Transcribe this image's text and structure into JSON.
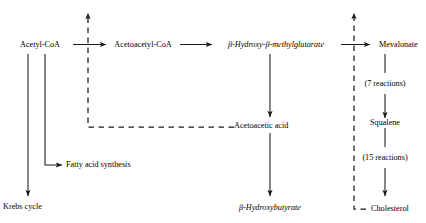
{
  "diagram": {
    "background_color": "#ffffff",
    "line_color": "#1a1a1a",
    "text_color": "#000000",
    "nodes": {
      "acetyl_coa": "Acetyl-CoA",
      "acetoacetyl_coa": "Acetoacetyl-CoA",
      "hmg": "β-Hydroxy-β-methylglutarate",
      "mevalonate": "Mevalonate",
      "acetoacetic_acid": "Acetoacetic acid",
      "squalene": "Squalene",
      "fatty_acid_synthesis": "Fatty acid synthesis",
      "krebs_cycle": "Krebs cycle",
      "hydroxybutyrate": "β-Hydroxybutyrate",
      "cholesterol": "Cholesterol"
    },
    "edge_labels": {
      "seven_reactions": "(7 reactions)",
      "fifteen_reactions": "(15 reactions)"
    },
    "edges": [
      {
        "from": "acetyl_coa",
        "to": "acetoacetyl_coa",
        "style": "solid",
        "direction": "right"
      },
      {
        "from": "acetoacetyl_coa",
        "to": "hmg",
        "style": "solid",
        "direction": "right"
      },
      {
        "from": "hmg",
        "to": "mevalonate",
        "style": "solid",
        "direction": "right"
      },
      {
        "from": "hmg",
        "to": "acetoacetic_acid",
        "style": "solid",
        "direction": "down"
      },
      {
        "from": "acetoacetic_acid",
        "to": "hydroxybutyrate",
        "style": "solid",
        "direction": "down"
      },
      {
        "from": "acetyl_coa",
        "to": "fatty_acid_synthesis",
        "style": "solid",
        "direction": "down-right"
      },
      {
        "from": "acetyl_coa",
        "to": "krebs_cycle",
        "style": "solid",
        "direction": "down"
      },
      {
        "from": "mevalonate",
        "to": "squalene",
        "style": "solid",
        "direction": "down",
        "label": "seven_reactions"
      },
      {
        "from": "squalene",
        "to": "cholesterol",
        "style": "solid",
        "direction": "down",
        "label": "fifteen_reactions"
      },
      {
        "from": "acetoacetic_acid",
        "to": "acetyl_coa_to_acetoacetyl_step",
        "style": "dashed",
        "direction": "up",
        "meaning": "feedback inhibition"
      },
      {
        "from": "cholesterol",
        "to": "hmg_to_mevalonate_step",
        "style": "dashed",
        "direction": "up",
        "meaning": "feedback inhibition"
      }
    ]
  }
}
